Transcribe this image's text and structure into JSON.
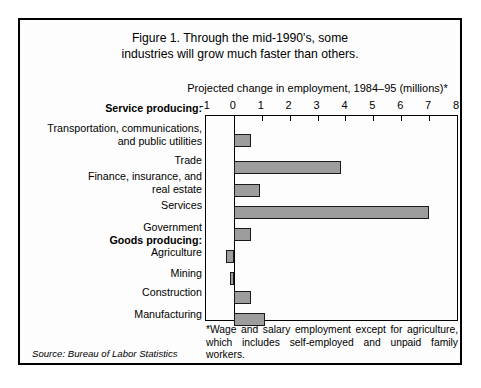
{
  "figure": {
    "title_line1": "Figure 1. Through the mid-1990's, some",
    "title_line2": "industries will grow much faster than others.",
    "axis_caption": "Projected change in employment, 1984–95 (millions)*",
    "footnote": "*Wage and salary employment except for agriculture, which includes self-employed and unpaid family workers.",
    "source": "Source: Bureau of Labor Statistics",
    "bar_fill": "#9d9d9d",
    "bar_stroke": "#1a1a1a",
    "frame_color": "#000000",
    "background": "#fdfdfd"
  },
  "chart_data": {
    "type": "bar",
    "orientation": "horizontal",
    "title": "Figure 1. Through the mid-1990's, some industries will grow much faster than others.",
    "subtitle": "Projected change in employment, 1984–95 (millions)*",
    "xlabel": "Projected change in employment, 1984–95 (millions)",
    "ylabel": "",
    "xlim": [
      -1,
      8
    ],
    "xticks": [
      -1,
      0,
      1,
      2,
      3,
      4,
      5,
      6,
      7,
      8
    ],
    "xtick_labels": [
      "-1",
      "0",
      "1",
      "2",
      "3",
      "4",
      "5",
      "6",
      "7",
      "8"
    ],
    "grid": false,
    "legend": null,
    "groups": [
      {
        "label": "Service producing:",
        "categories": [
          "Transportation, communications,\nand public utilities",
          "Trade",
          "Finance, insurance, and\nreal estate",
          "Services",
          "Government"
        ],
        "values": [
          0.6,
          3.85,
          0.95,
          7.0,
          0.6
        ]
      },
      {
        "label": "Goods producing:",
        "categories": [
          "Agriculture",
          "Mining",
          "Construction",
          "Manufacturing"
        ],
        "values": [
          -0.3,
          -0.15,
          0.6,
          1.1
        ]
      }
    ],
    "categories": [
      "Transportation, communications, and public utilities",
      "Trade",
      "Finance, insurance, and real estate",
      "Services",
      "Government",
      "Agriculture",
      "Mining",
      "Construction",
      "Manufacturing"
    ],
    "values": [
      0.6,
      3.85,
      0.95,
      7.0,
      0.6,
      -0.3,
      -0.15,
      0.6,
      1.1
    ]
  },
  "rows": [
    {
      "kind": "group",
      "label": "Service producing:",
      "y": -13,
      "lines": 1
    },
    {
      "kind": "bar",
      "label": "Transportation, communications,\nand public utilities",
      "value": 0.6,
      "bar_y": 18,
      "label_y": 7,
      "lines": 2
    },
    {
      "kind": "bar",
      "label": "Trade",
      "value": 3.85,
      "bar_y": 45,
      "label_y": 39,
      "lines": 1
    },
    {
      "kind": "bar",
      "label": "Finance, insurance, and\nreal estate",
      "value": 0.95,
      "bar_y": 68,
      "label_y": 55,
      "lines": 2
    },
    {
      "kind": "bar",
      "label": "Services",
      "value": 7.0,
      "bar_y": 90,
      "label_y": 84,
      "lines": 1
    },
    {
      "kind": "bar",
      "label": "Government",
      "value": 0.6,
      "bar_y": 112,
      "label_y": 106,
      "lines": 1
    },
    {
      "kind": "group",
      "label": "Goods producing:",
      "y": 119,
      "lines": 1
    },
    {
      "kind": "bar",
      "label": "Agriculture",
      "value": -0.3,
      "bar_y": 134,
      "label_y": 131,
      "lines": 1
    },
    {
      "kind": "bar",
      "label": "Mining",
      "value": -0.15,
      "bar_y": 156,
      "label_y": 152,
      "lines": 1
    },
    {
      "kind": "bar",
      "label": "Construction",
      "value": 0.6,
      "bar_y": 175,
      "label_y": 171,
      "lines": 1
    },
    {
      "kind": "bar",
      "label": "Manufacturing",
      "value": 1.1,
      "bar_y": 197,
      "label_y": 193,
      "lines": 1
    }
  ]
}
